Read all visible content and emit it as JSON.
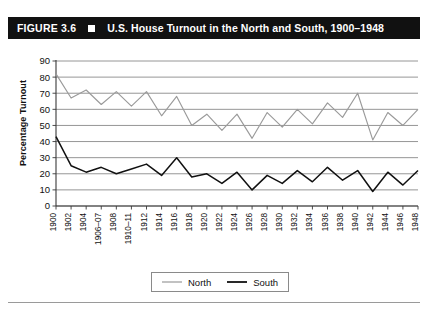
{
  "figure": {
    "number_label": "FIGURE 3.6",
    "marker_icon": "filled-square-icon",
    "title": "U.S. House Turnout in the North and South, 1900–1948"
  },
  "legend": {
    "position": "bottom-center",
    "entries": [
      {
        "label": "North",
        "color": "#9a9a9a"
      },
      {
        "label": "South",
        "color": "#111111"
      }
    ]
  },
  "chart_data": {
    "type": "line",
    "title": "U.S. House Turnout in the North and South, 1900–1948",
    "xlabel": "",
    "ylabel": "Percentage Turnout",
    "ylim": [
      0,
      90
    ],
    "yticks": [
      0,
      10,
      20,
      30,
      40,
      50,
      60,
      70,
      80,
      90
    ],
    "ytick_labels": [
      "0",
      "10",
      "20",
      "30",
      "40",
      "50",
      "60",
      "70",
      "80",
      "90"
    ],
    "grid": true,
    "grid_axis": "y",
    "categories": [
      "1900",
      "1902",
      "1904",
      "1906–07",
      "1908",
      "1910–11",
      "1912",
      "1914",
      "1916",
      "1918",
      "1920",
      "1922",
      "1924",
      "1926",
      "1928",
      "1930",
      "1932",
      "1934",
      "1936",
      "1938",
      "1940",
      "1942",
      "1944",
      "1946",
      "1948"
    ],
    "series": [
      {
        "name": "North",
        "color": "#9a9a9a",
        "values": [
          82,
          67,
          72,
          63,
          71,
          62,
          71,
          56,
          68,
          50,
          57,
          47,
          57,
          42,
          58,
          49,
          60,
          51,
          64,
          55,
          70,
          41,
          58,
          50,
          60
        ]
      },
      {
        "name": "South",
        "color": "#111111",
        "values": [
          43,
          25,
          21,
          24,
          20,
          23,
          26,
          19,
          30,
          18,
          20,
          14,
          21,
          10,
          19,
          14,
          22,
          15,
          24,
          16,
          22,
          9,
          21,
          13,
          22
        ]
      }
    ]
  }
}
